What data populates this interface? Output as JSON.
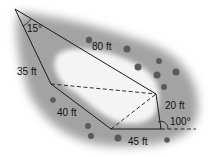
{
  "diagram": {
    "type": "polygon-lot",
    "angles": {
      "apex": "15°",
      "bottom_right_exterior": "100°"
    },
    "sides": {
      "top": "80 ft",
      "left_upper": "35 ft",
      "left_lower": "40 ft",
      "bottom": "45 ft",
      "right": "20 ft"
    },
    "colors": {
      "land": "#9a9a9a",
      "pond": "#f2f2f2",
      "lines": "#1a1a1a",
      "trees": "#555555"
    }
  }
}
